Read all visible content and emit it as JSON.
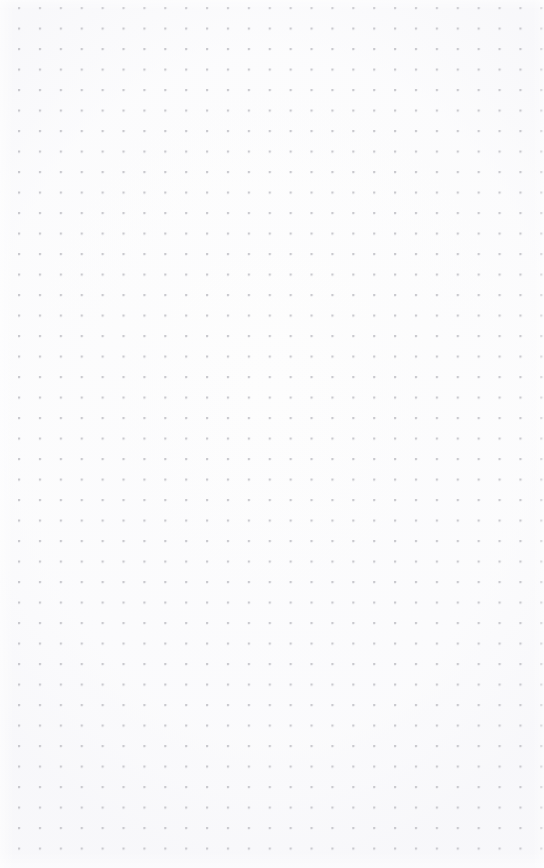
{
  "canvas": {
    "name": "dot-grid-canvas",
    "width": 544,
    "height": 868,
    "background_color": "#fdfdfd",
    "content_text": "",
    "has_content": false
  },
  "grid": {
    "pattern": "dot-grid",
    "dot_color": "#c9c9ce",
    "dot_size_px": 2,
    "spacing_x_px": 20.9,
    "spacing_y_px": 20.5,
    "origin_x_px": 19,
    "origin_y_px": 8,
    "columns": 25,
    "rows": 42
  }
}
